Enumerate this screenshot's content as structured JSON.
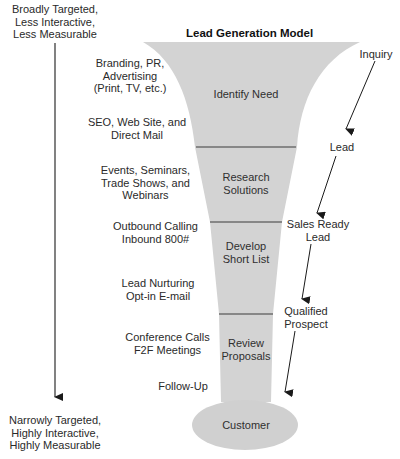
{
  "title": "Lead Generation Model",
  "colors": {
    "funnel_fill": "#d3d3d3",
    "divider": "#6e6e6e",
    "text": "#2a2a2a",
    "arrow": "#1a1a1a",
    "background": "#ffffff"
  },
  "axis": {
    "top_label_lines": [
      "Broadly Targeted,",
      "Less Interactive,",
      "Less Measurable"
    ],
    "bottom_label_lines": [
      "Narrowly Targeted,",
      "Highly Interactive,",
      "Highly Measurable"
    ]
  },
  "tactics": [
    {
      "lines": [
        "Branding, PR,",
        "Advertising",
        "(Print, TV, etc.)"
      ]
    },
    {
      "lines": [
        "SEO, Web Site, and",
        "Direct Mail"
      ]
    },
    {
      "lines": [
        "Events, Seminars,",
        "Trade Shows, and",
        "Webinars"
      ]
    },
    {
      "lines": [
        "Outbound Calling",
        "Inbound 800#"
      ]
    },
    {
      "lines": [
        "Lead Nurturing",
        "Opt-in E-mail"
      ]
    },
    {
      "lines": [
        "Conference Calls",
        "F2F Meetings"
      ]
    },
    {
      "lines": [
        "Follow-Up"
      ]
    }
  ],
  "stages": [
    {
      "lines": [
        "Identify Need"
      ]
    },
    {
      "lines": [
        "Research",
        "Solutions"
      ]
    },
    {
      "lines": [
        "Develop",
        "Short List"
      ]
    },
    {
      "lines": [
        "Review",
        "Proposals"
      ]
    },
    {
      "lines": [
        "Customer"
      ]
    }
  ],
  "lead_states": [
    {
      "lines": [
        "Inquiry"
      ]
    },
    {
      "lines": [
        "Lead"
      ]
    },
    {
      "lines": [
        "Sales Ready",
        "Lead"
      ]
    },
    {
      "lines": [
        "Qualified",
        "Prospect"
      ]
    }
  ]
}
